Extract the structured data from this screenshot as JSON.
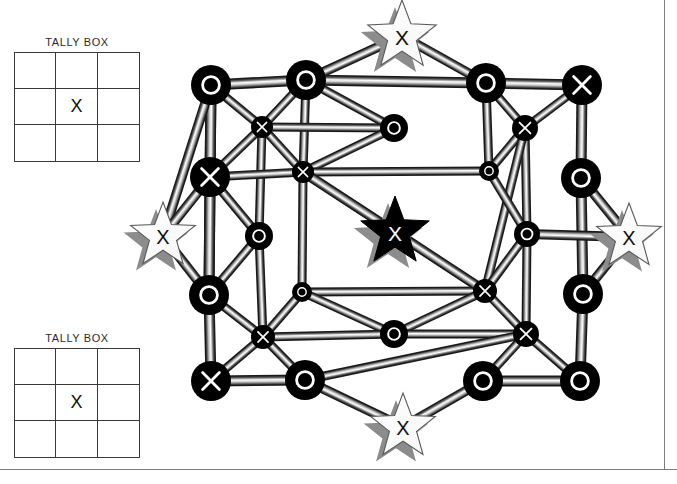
{
  "page": {
    "background": "#ffffff",
    "rule_color": "#7d7d7d",
    "width": 677,
    "height": 484
  },
  "tally_boxes": [
    {
      "id": "tally-top",
      "title": "TALLY BOX",
      "cells": [
        "",
        "",
        "",
        "",
        "X",
        "",
        "",
        "",
        ""
      ]
    },
    {
      "id": "tally-bot",
      "title": "TALLY BOX",
      "cells": [
        "",
        "",
        "",
        "",
        "X",
        "",
        "",
        "",
        ""
      ]
    }
  ],
  "diagram": {
    "node_fill": "#000000",
    "node_mark_color": "#ffffff",
    "edge_light": "#f2f2f2",
    "edge_mid": "#9a9a9a",
    "edge_dark": "#1a1a1a",
    "star_fill_light": "#ffffff",
    "star_fill_dark": "#000000",
    "star_shadow": "#8c8c8c",
    "nodes": [
      {
        "id": "n1",
        "x": 211,
        "y": 85,
        "r": 20,
        "mark": "O"
      },
      {
        "id": "n2",
        "x": 306,
        "y": 80,
        "r": 20,
        "mark": "O"
      },
      {
        "id": "n3",
        "x": 486,
        "y": 83,
        "r": 20,
        "mark": "O"
      },
      {
        "id": "n4",
        "x": 582,
        "y": 85,
        "r": 20,
        "mark": "X"
      },
      {
        "id": "n5",
        "x": 262,
        "y": 127,
        "r": 11,
        "mark": "X"
      },
      {
        "id": "n6",
        "x": 394,
        "y": 128,
        "r": 14,
        "mark": "O"
      },
      {
        "id": "n7",
        "x": 525,
        "y": 128,
        "r": 13,
        "mark": "X"
      },
      {
        "id": "n8",
        "x": 210,
        "y": 177,
        "r": 20,
        "mark": "X"
      },
      {
        "id": "n9",
        "x": 303,
        "y": 172,
        "r": 11,
        "mark": "X"
      },
      {
        "id": "n10",
        "x": 489,
        "y": 171,
        "r": 10,
        "mark": "O"
      },
      {
        "id": "n11",
        "x": 581,
        "y": 178,
        "r": 20,
        "mark": "O"
      },
      {
        "id": "n12",
        "x": 259,
        "y": 236,
        "r": 14,
        "mark": "O"
      },
      {
        "id": "n13",
        "x": 527,
        "y": 234,
        "r": 13,
        "mark": "O"
      },
      {
        "id": "n14",
        "x": 209,
        "y": 295,
        "r": 20,
        "mark": "O"
      },
      {
        "id": "n15",
        "x": 302,
        "y": 292,
        "r": 10,
        "mark": "O"
      },
      {
        "id": "n16",
        "x": 583,
        "y": 294,
        "r": 20,
        "mark": "O"
      },
      {
        "id": "n17",
        "x": 485,
        "y": 291,
        "r": 12,
        "mark": "X"
      },
      {
        "id": "n18",
        "x": 263,
        "y": 337,
        "r": 12,
        "mark": "X"
      },
      {
        "id": "n19",
        "x": 394,
        "y": 334,
        "r": 14,
        "mark": "O"
      },
      {
        "id": "n20",
        "x": 526,
        "y": 334,
        "r": 13,
        "mark": "X"
      },
      {
        "id": "n21",
        "x": 211,
        "y": 381,
        "r": 20,
        "mark": "X"
      },
      {
        "id": "n22",
        "x": 305,
        "y": 380,
        "r": 20,
        "mark": "O"
      },
      {
        "id": "n23",
        "x": 483,
        "y": 381,
        "r": 20,
        "mark": "O"
      },
      {
        "id": "n24",
        "x": 580,
        "y": 381,
        "r": 20,
        "mark": "O"
      }
    ],
    "edges": [
      [
        "n1",
        "n2"
      ],
      [
        "n1",
        "n5"
      ],
      [
        "n1",
        "n8"
      ],
      [
        "n1",
        "n14"
      ],
      [
        "n2",
        "n5"
      ],
      [
        "n2",
        "n6"
      ],
      [
        "n2",
        "n9"
      ],
      [
        "n2",
        "n3"
      ],
      [
        "n3",
        "n4"
      ],
      [
        "n3",
        "n7"
      ],
      [
        "n3",
        "n10"
      ],
      [
        "n4",
        "n7"
      ],
      [
        "n4",
        "n11"
      ],
      [
        "n5",
        "n6"
      ],
      [
        "n5",
        "n8"
      ],
      [
        "n5",
        "n9"
      ],
      [
        "n5",
        "n12"
      ],
      [
        "n6",
        "n9"
      ],
      [
        "n7",
        "n10"
      ],
      [
        "n7",
        "n13"
      ],
      [
        "n7",
        "n17"
      ],
      [
        "n8",
        "n12"
      ],
      [
        "n8",
        "n14"
      ],
      [
        "n8",
        "n9"
      ],
      [
        "n9",
        "n10"
      ],
      [
        "n9",
        "n15"
      ],
      [
        "n9",
        "n17"
      ],
      [
        "n10",
        "n13"
      ],
      [
        "n11",
        "n16"
      ],
      [
        "n12",
        "n18"
      ],
      [
        "n12",
        "n14"
      ],
      [
        "n13",
        "n17"
      ],
      [
        "n13",
        "n20"
      ],
      [
        "n14",
        "n18"
      ],
      [
        "n14",
        "n21"
      ],
      [
        "n15",
        "n17"
      ],
      [
        "n15",
        "n18"
      ],
      [
        "n15",
        "n19"
      ],
      [
        "n16",
        "n24"
      ],
      [
        "n17",
        "n19"
      ],
      [
        "n17",
        "n20"
      ],
      [
        "n18",
        "n19"
      ],
      [
        "n18",
        "n21"
      ],
      [
        "n18",
        "n22"
      ],
      [
        "n19",
        "n20"
      ],
      [
        "n20",
        "n23"
      ],
      [
        "n20",
        "n24"
      ],
      [
        "n20",
        "n22"
      ],
      [
        "n21",
        "n22"
      ],
      [
        "n23",
        "n24"
      ]
    ],
    "stars": [
      {
        "id": "s-top",
        "x": 402,
        "y": 36,
        "r": 36,
        "mark": "X",
        "style": "light"
      },
      {
        "id": "s-left",
        "x": 163,
        "y": 236,
        "r": 34,
        "mark": "X",
        "style": "light"
      },
      {
        "id": "s-center",
        "x": 395,
        "y": 232,
        "r": 36,
        "mark": "X",
        "style": "dark"
      },
      {
        "id": "s-right",
        "x": 629,
        "y": 237,
        "r": 34,
        "mark": "X",
        "style": "light"
      },
      {
        "id": "s-bottom",
        "x": 403,
        "y": 427,
        "r": 34,
        "mark": "X",
        "style": "light"
      }
    ],
    "star_edges": [
      [
        "s-top",
        "n2"
      ],
      [
        "s-top",
        "n3"
      ],
      [
        "s-left",
        "n1"
      ],
      [
        "s-left",
        "n8"
      ],
      [
        "s-left",
        "n14"
      ],
      [
        "s-center",
        "n9"
      ],
      [
        "s-center",
        "n17"
      ],
      [
        "s-right",
        "n11"
      ],
      [
        "s-right",
        "n16"
      ],
      [
        "s-right",
        "n13"
      ],
      [
        "s-bottom",
        "n22"
      ],
      [
        "s-bottom",
        "n23"
      ]
    ]
  }
}
